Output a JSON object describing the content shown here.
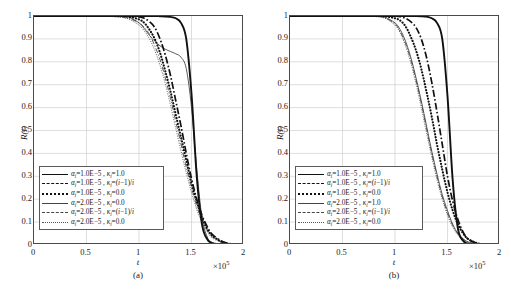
{
  "figure": {
    "caption": "",
    "multiplier": "×10",
    "multiplier_exp": "5"
  },
  "axes": {
    "ylabel": "R(t)",
    "xlabel": "t",
    "yticks": [
      "1",
      "0.9",
      "0.8",
      "0.7",
      "0.6",
      "0.5",
      "0.4",
      "0.3",
      "0.2",
      "0.1",
      "0"
    ],
    "xticks": [
      "0",
      "0.5",
      "1",
      "1.5",
      "2"
    ],
    "ylim": [
      0,
      1
    ],
    "xlim": [
      0,
      2
    ]
  },
  "panels": [
    {
      "tag": "(a)",
      "legend": [
        {
          "style": "solid-thick",
          "alpha": "1.0E−5",
          "kappa": "1.0"
        },
        {
          "style": "dashdot-thick",
          "alpha": "1.0E−5",
          "kappa": "(i−1)/i"
        },
        {
          "style": "dot-thick",
          "alpha": "1.0E−5",
          "kappa": "0.0"
        },
        {
          "style": "solid-thin",
          "alpha": "2.0E−5",
          "kappa": "0.0"
        },
        {
          "style": "dashdot-thin",
          "alpha": "2.0E−5",
          "kappa": "(i−1)/i"
        },
        {
          "style": "dot-fine",
          "alpha": "2.0E−5",
          "kappa": "0.0"
        }
      ]
    },
    {
      "tag": "(b)",
      "legend": [
        {
          "style": "solid-thick",
          "alpha": "1.0E−5",
          "kappa": "1.0"
        },
        {
          "style": "dashdot-thick",
          "alpha": "1.0E−5",
          "kappa": "(i−1)/i"
        },
        {
          "style": "dot-thick",
          "alpha": "1.0E−5",
          "kappa": "0.0"
        },
        {
          "style": "solid-thin",
          "alpha": "2.0E−5",
          "kappa": "1.0"
        },
        {
          "style": "dashdot-thin",
          "alpha": "2.0E−5",
          "kappa": "(i−1)/i"
        },
        {
          "style": "dot-fine",
          "alpha": "2.0E−5",
          "kappa": "0.0"
        }
      ]
    }
  ],
  "chart_data": [
    {
      "type": "line",
      "title": "(a)",
      "xlabel": "t",
      "ylabel": "R(t)",
      "xlim": [
        0,
        2
      ],
      "ylim": [
        0,
        1
      ],
      "x_multiplier": 100000,
      "grid": true,
      "legend_position": "lower-left-inside",
      "x": [
        0,
        0.1,
        0.2,
        0.3,
        0.4,
        0.5,
        0.6,
        0.7,
        0.8,
        0.9,
        1.0,
        1.05,
        1.1,
        1.15,
        1.2,
        1.25,
        1.3,
        1.35,
        1.4,
        1.45,
        1.5,
        1.55,
        1.6,
        1.65,
        1.7,
        1.8,
        1.9,
        2.0
      ],
      "series": [
        {
          "name": "αi=1.0E−5, κi=1.0",
          "style": "solid-thick",
          "values": [
            1,
            1,
            1,
            1,
            1,
            1,
            1,
            1,
            1,
            1,
            1,
            1,
            1,
            1,
            0.999,
            0.998,
            0.996,
            0.99,
            0.97,
            0.9,
            0.66,
            0.3,
            0.09,
            0.025,
            0.008,
            0.002,
            0.001,
            0
          ]
        },
        {
          "name": "αi=1.0E−5, κi=(i−1)/i",
          "style": "dashdot-thick",
          "values": [
            1,
            1,
            1,
            1,
            1,
            1,
            1,
            1,
            1,
            0.999,
            0.996,
            0.99,
            0.975,
            0.95,
            0.9,
            0.83,
            0.74,
            0.63,
            0.52,
            0.4,
            0.29,
            0.2,
            0.13,
            0.08,
            0.045,
            0.014,
            0.004,
            0.001
          ]
        },
        {
          "name": "αi=1.0E−5, κi=0.0",
          "style": "dot-thick",
          "values": [
            1,
            1,
            1,
            1,
            1,
            1,
            1,
            1,
            0.999,
            0.997,
            0.985,
            0.97,
            0.94,
            0.9,
            0.84,
            0.76,
            0.67,
            0.57,
            0.47,
            0.37,
            0.27,
            0.19,
            0.12,
            0.07,
            0.04,
            0.012,
            0.003,
            0.001
          ]
        },
        {
          "name": "αi=2.0E−5, κi=0.0 (thin solid)",
          "style": "solid-thin",
          "values": [
            1,
            1,
            1,
            1,
            1,
            1,
            1,
            1,
            0.999,
            0.995,
            0.97,
            0.945,
            0.915,
            0.89,
            0.87,
            0.855,
            0.845,
            0.835,
            0.82,
            0.77,
            0.6,
            0.33,
            0.12,
            0.035,
            0.01,
            0.002,
            0.001,
            0
          ]
        },
        {
          "name": "αi=2.0E−5, κi=(i−1)/i",
          "style": "dashdot-thin",
          "values": [
            1,
            1,
            1,
            1,
            1,
            1,
            1,
            0.999,
            0.997,
            0.99,
            0.97,
            0.95,
            0.92,
            0.87,
            0.81,
            0.73,
            0.64,
            0.54,
            0.44,
            0.34,
            0.25,
            0.17,
            0.11,
            0.065,
            0.035,
            0.01,
            0.003,
            0.001
          ]
        },
        {
          "name": "αi=2.0E−5, κi=0.0 (fine dotted)",
          "style": "dot-fine",
          "values": [
            1,
            1,
            1,
            1,
            1,
            1,
            1,
            0.999,
            0.996,
            0.987,
            0.96,
            0.935,
            0.9,
            0.85,
            0.785,
            0.705,
            0.61,
            0.51,
            0.41,
            0.315,
            0.23,
            0.155,
            0.1,
            0.058,
            0.03,
            0.009,
            0.002,
            0.001
          ]
        }
      ]
    },
    {
      "type": "line",
      "title": "(b)",
      "xlabel": "t",
      "ylabel": "R(t)",
      "xlim": [
        0,
        2
      ],
      "ylim": [
        0,
        1
      ],
      "x_multiplier": 100000,
      "grid": true,
      "legend_position": "lower-left-inside",
      "x": [
        0,
        0.1,
        0.2,
        0.3,
        0.4,
        0.5,
        0.6,
        0.7,
        0.8,
        0.9,
        1.0,
        1.05,
        1.1,
        1.15,
        1.2,
        1.25,
        1.3,
        1.35,
        1.4,
        1.45,
        1.5,
        1.55,
        1.6,
        1.65,
        1.7,
        1.8,
        1.9,
        2.0
      ],
      "series": [
        {
          "name": "αi=1.0E−5, κi=1.0",
          "style": "solid-thick",
          "values": [
            1,
            1,
            1,
            1,
            1,
            1,
            1,
            1,
            1,
            1,
            1,
            1,
            1,
            1,
            1,
            0.999,
            0.997,
            0.99,
            0.97,
            0.9,
            0.65,
            0.28,
            0.07,
            0.018,
            0.005,
            0.001,
            0,
            0
          ]
        },
        {
          "name": "αi=1.0E−5, κi=(i−1)/i",
          "style": "dashdot-thick",
          "values": [
            1,
            1,
            1,
            1,
            1,
            1,
            1,
            1,
            1,
            1,
            0.999,
            0.997,
            0.99,
            0.975,
            0.95,
            0.9,
            0.82,
            0.71,
            0.58,
            0.44,
            0.3,
            0.19,
            0.11,
            0.055,
            0.025,
            0.005,
            0.001,
            0
          ]
        },
        {
          "name": "αi=1.0E−5, κi=0.0",
          "style": "dot-thick",
          "values": [
            1,
            1,
            1,
            1,
            1,
            1,
            1,
            1,
            1,
            0.999,
            0.99,
            0.98,
            0.955,
            0.91,
            0.85,
            0.77,
            0.67,
            0.56,
            0.44,
            0.33,
            0.23,
            0.15,
            0.09,
            0.05,
            0.025,
            0.006,
            0.001,
            0
          ]
        },
        {
          "name": "αi=2.0E−5, κi=1.0",
          "style": "solid-thin",
          "values": [
            1,
            1,
            1,
            1,
            1,
            1,
            1,
            1,
            0.999,
            0.995,
            0.97,
            0.94,
            0.89,
            0.82,
            0.73,
            0.63,
            0.52,
            0.41,
            0.31,
            0.22,
            0.15,
            0.09,
            0.05,
            0.027,
            0.013,
            0.003,
            0.001,
            0
          ]
        },
        {
          "name": "αi=2.0E−5, κi=(i−1)/i",
          "style": "dashdot-thin",
          "values": [
            1,
            1,
            1,
            1,
            1,
            1,
            1,
            1,
            0.998,
            0.993,
            0.965,
            0.932,
            0.88,
            0.81,
            0.72,
            0.62,
            0.51,
            0.4,
            0.3,
            0.21,
            0.14,
            0.085,
            0.048,
            0.025,
            0.012,
            0.003,
            0.001,
            0
          ]
        },
        {
          "name": "αi=2.0E−5, κi=0.0",
          "style": "dot-fine",
          "values": [
            1,
            1,
            1,
            1,
            1,
            1,
            1,
            1,
            0.998,
            0.991,
            0.96,
            0.925,
            0.87,
            0.795,
            0.705,
            0.6,
            0.49,
            0.385,
            0.285,
            0.2,
            0.13,
            0.078,
            0.043,
            0.022,
            0.01,
            0.002,
            0.001,
            0
          ]
        }
      ]
    }
  ]
}
